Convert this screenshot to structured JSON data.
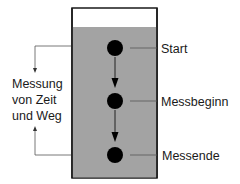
{
  "diagram": {
    "colors": {
      "fluid": "#a3a3a3",
      "container_border": "#1a1a1a",
      "ball": "#000000",
      "line": "#555555"
    },
    "stages": [
      {
        "label": "Start",
        "y": 48
      },
      {
        "label": "Messbeginn",
        "y": 101
      },
      {
        "label": "Messende",
        "y": 155
      }
    ],
    "side_annotation": {
      "lines": [
        "Messung",
        "von Zeit",
        "und Weg"
      ]
    }
  }
}
